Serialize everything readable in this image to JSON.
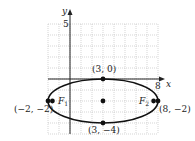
{
  "figure": {
    "type": "ellipse-graph",
    "axes": {
      "x_label": "x",
      "y_label": "y",
      "x_tick_label": "8",
      "y_tick_label": "5",
      "x_range": [
        -2,
        8
      ],
      "y_range": [
        -5,
        5
      ]
    },
    "ellipse": {
      "center": [
        3,
        -2
      ],
      "vertices": [
        [
          -2,
          -2
        ],
        [
          8,
          -2
        ]
      ],
      "co_vertices": [
        [
          3,
          0
        ],
        [
          3,
          -4
        ]
      ]
    },
    "foci": [
      {
        "name": "F1",
        "sub": "1",
        "x": -1.6,
        "y": -2
      },
      {
        "name": "F2",
        "sub": "2",
        "x": 7.6,
        "y": -2
      }
    ],
    "point_labels": {
      "top": "(3, 0)",
      "bottom": "(3, −4)",
      "left": "(−2, −2)",
      "right": "(8, −2)",
      "f1_letter": "F",
      "f1_sub": "1",
      "f2_letter": "F",
      "f2_sub": "2"
    },
    "colors": {
      "curve": "#111111",
      "grid": "#bbbbbb",
      "axis": "#222222"
    }
  }
}
